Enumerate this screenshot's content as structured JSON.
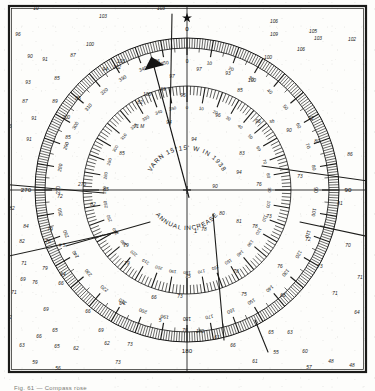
{
  "document": {
    "kind": "nautical-chart-excerpt",
    "caption": "Fig.  61 — Compass rose",
    "center_mark": "+"
  },
  "compass_rose": {
    "center": {
      "x": 187,
      "y": 190
    },
    "true_ring": {
      "label": "true-bearing-ring",
      "radius": 152,
      "tick_degrees": 1,
      "major_tick_degrees": 10,
      "number_degrees": 10,
      "numbers": [
        0,
        10,
        20,
        30,
        40,
        50,
        60,
        70,
        80,
        90,
        100,
        110,
        120,
        130,
        140,
        150,
        160,
        170,
        180,
        190,
        200,
        210,
        220,
        230,
        240,
        250,
        260,
        270,
        280,
        290,
        300,
        310,
        320,
        330,
        340,
        350
      ],
      "cardinal_labels": [
        {
          "deg": 0,
          "text": "0"
        },
        {
          "deg": 90,
          "text": "90"
        },
        {
          "deg": 180,
          "text": "180"
        },
        {
          "deg": 270,
          "text": "270"
        }
      ]
    },
    "magnetic_ring": {
      "label": "magnetic-bearing-ring",
      "radius": 104,
      "tick_degrees": 2,
      "major_tick_degrees": 10,
      "numbers": [
        0,
        10,
        20,
        30,
        40,
        50,
        60,
        70,
        80,
        90,
        100,
        110,
        120,
        130,
        140,
        150,
        160,
        170,
        180,
        190,
        200,
        210,
        220,
        230,
        240,
        250,
        260,
        270,
        280,
        290,
        300,
        310,
        320,
        330,
        340,
        350
      ]
    },
    "north_star_marker": "star-icon",
    "true_north_line_label": "true-north-line",
    "magnetic_north_arrow": {
      "label": "magnetic-north-arrow",
      "bearing_deg": 345
    },
    "variation_text": "VARN 15°15' W IN 1938",
    "annual_increase_text": "ANNUAL INCREASE",
    "annual_increase_value": "1'"
  },
  "survey_lines": [
    {
      "name": "survey-line-nw",
      "x1": 0,
      "y1": 184,
      "x2": 104,
      "y2": 193
    },
    {
      "name": "survey-line-ne",
      "x1": 262,
      "y1": 166,
      "x2": 375,
      "y2": 182
    },
    {
      "name": "survey-line-w",
      "x1": 0,
      "y1": 258,
      "x2": 118,
      "y2": 232
    },
    {
      "name": "survey-line-s",
      "x1": 213,
      "y1": 214,
      "x2": 224,
      "y2": 340
    },
    {
      "name": "survey-line-n",
      "x1": 172,
      "y1": 14,
      "x2": 170,
      "y2": 125
    },
    {
      "name": "survey-line-sw",
      "x1": 66,
      "y1": 246,
      "x2": 150,
      "y2": 222
    },
    {
      "name": "survey-line-se",
      "x1": 255,
      "y1": 320,
      "x2": 268,
      "y2": 352
    },
    {
      "name": "survey-line-e",
      "x1": 300,
      "y1": 222,
      "x2": 375,
      "y2": 238
    }
  ],
  "grid_lines": {
    "vertical": [
      187
    ],
    "horizontal": [
      190
    ]
  },
  "soundings": [
    {
      "v": "10",
      "x": 36,
      "y": 10
    },
    {
      "v": "103",
      "x": 103,
      "y": 18
    },
    {
      "v": "103",
      "x": 161,
      "y": 10
    },
    {
      "v": "106",
      "x": 274,
      "y": 23
    },
    {
      "v": "102",
      "x": 352,
      "y": 41
    },
    {
      "v": "96",
      "x": 18,
      "y": 36
    },
    {
      "v": "109",
      "x": 274,
      "y": 36
    },
    {
      "v": "105",
      "x": 313,
      "y": 33
    },
    {
      "v": "103",
      "x": 318,
      "y": 40
    },
    {
      "v": "90",
      "x": 30,
      "y": 58
    },
    {
      "v": "100",
      "x": 90,
      "y": 46
    },
    {
      "v": "106",
      "x": 301,
      "y": 51
    },
    {
      "v": "91",
      "x": 45,
      "y": 61
    },
    {
      "v": "87",
      "x": 73,
      "y": 57
    },
    {
      "v": "103",
      "x": 121,
      "y": 63
    },
    {
      "v": "102",
      "x": 117,
      "y": 69
    },
    {
      "v": "94",
      "x": 105,
      "y": 71
    },
    {
      "v": "96",
      "x": 157,
      "y": 63
    },
    {
      "v": "97",
      "x": 199,
      "y": 71
    },
    {
      "v": "97",
      "x": 172,
      "y": 78
    },
    {
      "v": "100",
      "x": 268,
      "y": 59
    },
    {
      "v": "85",
      "x": 57,
      "y": 80
    },
    {
      "v": "93",
      "x": 228,
      "y": 75
    },
    {
      "v": "100",
      "x": 252,
      "y": 82
    },
    {
      "v": "93",
      "x": 28,
      "y": 84
    },
    {
      "v": "89",
      "x": 163,
      "y": 91
    },
    {
      "v": "106",
      "x": 147,
      "y": 96
    },
    {
      "v": "96",
      "x": 183,
      "y": 97
    },
    {
      "v": "85",
      "x": 78,
      "y": 100
    },
    {
      "v": "82",
      "x": 140,
      "y": 104
    },
    {
      "v": "85",
      "x": 240,
      "y": 92
    },
    {
      "v": "87",
      "x": 25,
      "y": 103
    },
    {
      "v": "89",
      "x": 55,
      "y": 103
    },
    {
      "v": "200",
      "x": 66,
      "y": 119
    },
    {
      "v": "71 M",
      "x": 139,
      "y": 128
    },
    {
      "v": "94",
      "x": 169,
      "y": 124
    },
    {
      "v": "96",
      "x": 218,
      "y": 117
    },
    {
      "v": "96",
      "x": 258,
      "y": 123
    },
    {
      "v": "sh",
      "x": 272,
      "y": 123
    },
    {
      "v": "91",
      "x": 34,
      "y": 120
    },
    {
      "v": "86",
      "x": 9,
      "y": 128
    },
    {
      "v": "92",
      "x": 311,
      "y": 120
    },
    {
      "v": "91",
      "x": 29,
      "y": 141
    },
    {
      "v": "85",
      "x": 68,
      "y": 139
    },
    {
      "v": "94",
      "x": 194,
      "y": 141
    },
    {
      "v": "90",
      "x": 289,
      "y": 132
    },
    {
      "v": "80",
      "x": 317,
      "y": 143
    },
    {
      "v": "86",
      "x": 6,
      "y": 152
    },
    {
      "v": "85",
      "x": 122,
      "y": 155
    },
    {
      "v": "83",
      "x": 242,
      "y": 155
    },
    {
      "v": "86",
      "x": 350,
      "y": 156
    },
    {
      "v": "270",
      "x": 82,
      "y": 186
    },
    {
      "v": "72",
      "x": 60,
      "y": 198
    },
    {
      "v": "85",
      "x": 106,
      "y": 191
    },
    {
      "v": "82",
      "x": 93,
      "y": 206
    },
    {
      "v": "90",
      "x": 215,
      "y": 188
    },
    {
      "v": "76",
      "x": 259,
      "y": 186
    },
    {
      "v": "94",
      "x": 239,
      "y": 174
    },
    {
      "v": "73",
      "x": 300,
      "y": 178
    },
    {
      "v": "82",
      "x": 12,
      "y": 210
    },
    {
      "v": "80",
      "x": 222,
      "y": 215
    },
    {
      "v": "81",
      "x": 239,
      "y": 223
    },
    {
      "v": "78",
      "x": 204,
      "y": 231
    },
    {
      "v": "78",
      "x": 255,
      "y": 228
    },
    {
      "v": "73",
      "x": 269,
      "y": 218
    },
    {
      "v": "81",
      "x": 340,
      "y": 205
    },
    {
      "v": "84",
      "x": 26,
      "y": 228
    },
    {
      "v": "79",
      "x": 50,
      "y": 231
    },
    {
      "v": "82",
      "x": 22,
      "y": 243
    },
    {
      "v": "72",
      "x": 308,
      "y": 241
    },
    {
      "v": "76",
      "x": 48,
      "y": 243
    },
    {
      "v": "# 5",
      "x": 62,
      "y": 247
    },
    {
      "v": "71",
      "x": 24,
      "y": 265
    },
    {
      "v": "76",
      "x": 35,
      "y": 284
    },
    {
      "v": "79",
      "x": 126,
      "y": 247
    },
    {
      "v": "79",
      "x": 127,
      "y": 265
    },
    {
      "v": "79",
      "x": 45,
      "y": 270
    },
    {
      "v": "69",
      "x": 23,
      "y": 281
    },
    {
      "v": "69",
      "x": 46,
      "y": 311
    },
    {
      "v": "71",
      "x": 14,
      "y": 294
    },
    {
      "v": "66",
      "x": 39,
      "y": 338
    },
    {
      "v": "64",
      "x": 63,
      "y": 276
    },
    {
      "v": "66",
      "x": 61,
      "y": 285
    },
    {
      "v": "75",
      "x": 188,
      "y": 278
    },
    {
      "v": "78",
      "x": 236,
      "y": 273
    },
    {
      "v": "76",
      "x": 280,
      "y": 268
    },
    {
      "v": "73",
      "x": 320,
      "y": 268
    },
    {
      "v": "70",
      "x": 348,
      "y": 247
    },
    {
      "v": "71",
      "x": 360,
      "y": 279
    },
    {
      "v": "64",
      "x": 122,
      "y": 305
    },
    {
      "v": "66",
      "x": 154,
      "y": 299
    },
    {
      "v": "73",
      "x": 180,
      "y": 298
    },
    {
      "v": "75",
      "x": 244,
      "y": 296
    },
    {
      "v": "66",
      "x": 283,
      "y": 297
    },
    {
      "v": "71",
      "x": 335,
      "y": 295
    },
    {
      "v": "64",
      "x": 357,
      "y": 314
    },
    {
      "v": "62",
      "x": 9,
      "y": 319
    },
    {
      "v": "66",
      "x": 88,
      "y": 313
    },
    {
      "v": "69",
      "x": 101,
      "y": 332
    },
    {
      "v": "65",
      "x": 55,
      "y": 332
    },
    {
      "v": "63",
      "x": 22,
      "y": 347
    },
    {
      "v": "62",
      "x": 76,
      "y": 350
    },
    {
      "v": "62",
      "x": 107,
      "y": 345
    },
    {
      "v": "73",
      "x": 130,
      "y": 346
    },
    {
      "v": "59",
      "x": 35,
      "y": 364
    },
    {
      "v": "56",
      "x": 58,
      "y": 370
    },
    {
      "v": "73",
      "x": 118,
      "y": 364
    },
    {
      "v": "76",
      "x": 185,
      "y": 332
    },
    {
      "v": "180",
      "x": 200,
      "y": 333
    },
    {
      "v": "61",
      "x": 217,
      "y": 339
    },
    {
      "v": "66",
      "x": 233,
      "y": 347
    },
    {
      "v": "65",
      "x": 271,
      "y": 334
    },
    {
      "v": "63",
      "x": 290,
      "y": 334
    },
    {
      "v": "55",
      "x": 276,
      "y": 354
    },
    {
      "v": "60",
      "x": 305,
      "y": 353
    },
    {
      "v": "61",
      "x": 255,
      "y": 363
    },
    {
      "v": "57",
      "x": 309,
      "y": 369
    },
    {
      "v": "48",
      "x": 331,
      "y": 363
    },
    {
      "v": "48",
      "x": 352,
      "y": 367
    },
    {
      "v": "48",
      "x": 368,
      "y": 367
    },
    {
      "v": "65",
      "x": 57,
      "y": 348
    },
    {
      "v": "5",
      "x": 160,
      "y": 322
    }
  ]
}
